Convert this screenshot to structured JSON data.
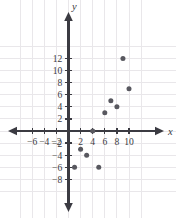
{
  "chart_data": {
    "type": "scatter",
    "title": "",
    "subtitle": "",
    "xlabel": "x",
    "ylabel": "y",
    "xlim": [
      -7.5,
      11.8
    ],
    "ylim": [
      -9.2,
      13.5
    ],
    "grid": true,
    "legend": null,
    "x_ticks": [
      -6,
      -4,
      -2,
      2,
      4,
      6,
      8,
      10
    ],
    "y_ticks": [
      12,
      10,
      8,
      6,
      4,
      2,
      -2,
      -4,
      -6,
      -8
    ],
    "x_tick_labels": [
      "−6",
      "−4",
      "−2",
      "2",
      "4",
      "6",
      "8",
      "10"
    ],
    "y_tick_labels": [
      "12",
      "10",
      "8",
      "6",
      "4",
      "2",
      "−2",
      "−4",
      "−6",
      "−8"
    ],
    "tick_step": 2,
    "grid_step": 2,
    "points": [
      {
        "x": 1,
        "y": -6
      },
      {
        "x": 2,
        "y": -3
      },
      {
        "x": 3,
        "y": -4
      },
      {
        "x": 4,
        "y": 0
      },
      {
        "x": 5,
        "y": -6
      },
      {
        "x": 6,
        "y": 3
      },
      {
        "x": 7,
        "y": 5
      },
      {
        "x": 8,
        "y": 4
      },
      {
        "x": 9,
        "y": 12
      },
      {
        "x": 10,
        "y": 7
      }
    ],
    "point_color": "#58585f",
    "axis_color": "#3b3b42",
    "grid_color": "#e9e7ea",
    "background": "#ffffff"
  }
}
